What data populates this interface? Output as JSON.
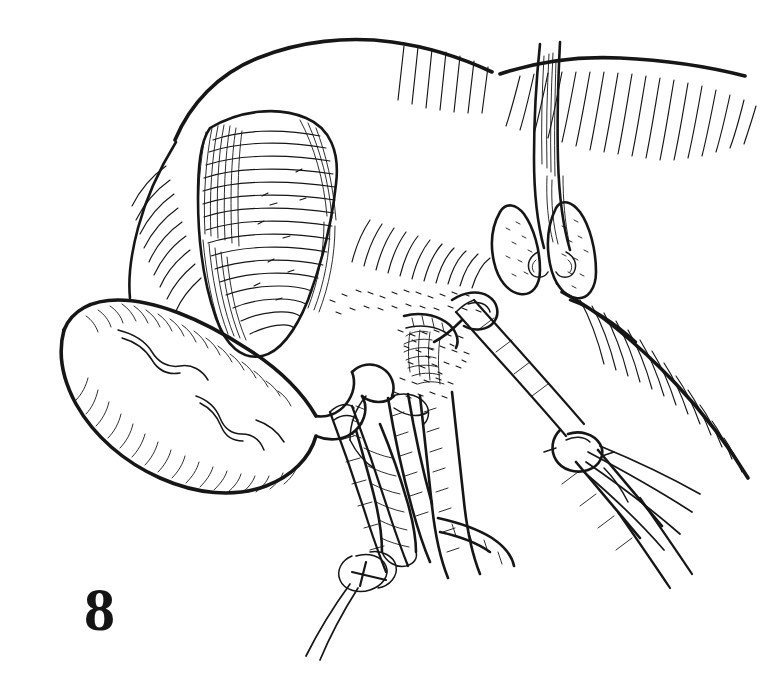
{
  "figure": {
    "number": "8",
    "caption_text": "",
    "domain": "surgical line-art illustration",
    "technique": "pen-and-ink line engraving with cross-hatching and stipple",
    "ink_color": "#161616",
    "paper_color": "#ffffff",
    "canvas": {
      "width": 772,
      "height": 681
    }
  },
  "anatomy": [
    {
      "id": "liver-right-lobe",
      "label": "Right lobe of liver",
      "note": "large retracted mass, upper field, long parallel hatch on inferior surface"
    },
    {
      "id": "liver-left-lobe",
      "label": "Left lobe of liver",
      "note": "right of falciform, hatched margin sweeping to lower right"
    },
    {
      "id": "falciform-ligament",
      "label": "Falciform ligament",
      "note": "vertical banded fold at top centre-right"
    },
    {
      "id": "gallbladder",
      "label": "Gallbladder",
      "note": "pear-shaped organ at left, fundus to lower-left, serosal vessels visible"
    },
    {
      "id": "cystic-duct",
      "label": "Cystic duct",
      "note": "tubular structure descending from gallbladder neck, ligature applied"
    },
    {
      "id": "cystic-artery",
      "label": "Cystic artery",
      "note": "short vessel grasped by forceps at the hilum"
    },
    {
      "id": "common-bile-duct",
      "label": "Common bile duct",
      "note": "broad duct descending in the hepatoduodenal ligament"
    },
    {
      "id": "hepatic-artery",
      "label": "Hepatic artery",
      "note": "branching vessel lying medial to the duct"
    },
    {
      "id": "calot-triangle",
      "label": "Triangle of Calot",
      "note": "densely stippled areolar tissue at centre of field"
    },
    {
      "id": "lymph-nodes",
      "label": "Lymph nodes",
      "note": "stippled nodular bodies, right of hilum"
    },
    {
      "id": "tumour-mass",
      "label": "Cross-hatched mass",
      "note": "heavily cross-hatched lesion in the liver bed, upper-left of centre"
    }
  ],
  "instruments": [
    {
      "id": "dissecting-forceps",
      "label": "Dissecting forceps",
      "note": "lower-right, jaws opened at the hilum, shaft to lower right"
    },
    {
      "id": "ligature-carrier",
      "label": "Ligature carrier",
      "note": "left instrument passing a tie around the cystic duct"
    },
    {
      "id": "suture-tie",
      "label": "Suture tie / ligature",
      "note": "knot encircling the cystic duct, free ends trailing down-left"
    },
    {
      "id": "trailing-wires",
      "label": "Trailing suture ends",
      "note": "three fine filaments sweeping to the lower right"
    }
  ],
  "accessibility": {
    "alt": "Black-and-white pen-and-ink surgical drawing showing the liver retracted upward, the gallbladder at the left, and two laparoscopic instruments dissecting the cystic duct and artery within the triangle of Calot. The plate is numbered 8 at the lower left."
  }
}
